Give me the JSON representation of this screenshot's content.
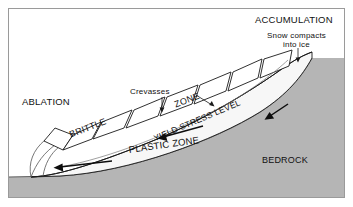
{
  "figure": {
    "title_alt": "Glacier cross-section: ablation, accumulation, brittle and plastic zones",
    "frame_color": "#9a9a9a",
    "background": "#ffffff",
    "ice_fill": "#f7f7f7",
    "bedrock_fill": "#b5b5b5",
    "line_color": "#1a1a1a"
  },
  "labels": {
    "accumulation": "ACCUMULATION",
    "ablation": "ABLATION",
    "bedrock": "BEDROCK",
    "brittle": "BRITTLE",
    "zone": "ZONE",
    "plastic_zone": "PLASTIC ZONE",
    "yield_stress_level": "YIELD STRESS LEVEL",
    "crevasses": "Crevasses",
    "snow_compacts_line1": "Snow compacts",
    "snow_compacts_line2": "into ice"
  },
  "annotations": [
    {
      "name": "crevasses-leader-left",
      "target": "crevasse-gap-3"
    },
    {
      "name": "crevasses-leader-right",
      "target": "crevasse-gap-4"
    },
    {
      "name": "snow-compacts-leader",
      "target": "accumulation-surface"
    }
  ],
  "flow_arrows": [
    {
      "name": "flow-arrow-lower",
      "direction": "left",
      "zone": "plastic"
    },
    {
      "name": "flow-arrow-mid",
      "direction": "left",
      "zone": "yield-stress-level"
    },
    {
      "name": "flow-arrow-upper",
      "direction": "down-left",
      "zone": "accumulation"
    }
  ],
  "crevasse_blocks": 7
}
